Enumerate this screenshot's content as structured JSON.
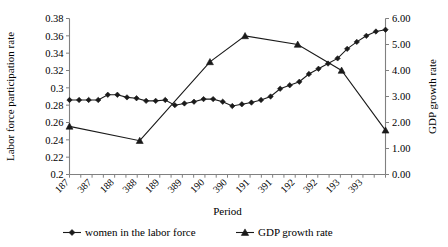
{
  "chart_data": {
    "type": "line",
    "title": "",
    "xlabel": "Period",
    "ylabel": "Labor force participation rate",
    "y2label": "GDP growth rate",
    "grid": false,
    "legend_position": "bottom",
    "ylim": [
      0.2,
      0.38
    ],
    "yticks": [
      "0.2",
      "0.22",
      "0.24",
      "0.26",
      "0.28",
      "0.3",
      "0.32",
      "0.34",
      "0.36",
      "0.38"
    ],
    "ytickvalues": [
      0.2,
      0.22,
      0.24,
      0.26,
      0.28,
      0.3,
      0.32,
      0.34,
      0.36,
      0.38
    ],
    "y2lim": [
      0.0,
      6.0
    ],
    "y2ticks": [
      "0.00",
      "1.00",
      "2.00",
      "3.00",
      "4.00",
      "5.00",
      "6.00"
    ],
    "y2tickvalues": [
      0,
      1,
      2,
      3,
      4,
      5,
      6
    ],
    "xtick_labels": [
      "187",
      "387",
      "188",
      "388",
      "189",
      "389",
      "190",
      "390",
      "191",
      "391",
      "192",
      "392",
      "193",
      "393"
    ],
    "n_points": 28,
    "series": [
      {
        "name": "women in the labor force",
        "marker": "diamond",
        "axis": "left",
        "values": [
          0.286,
          0.286,
          0.286,
          0.286,
          0.292,
          0.292,
          0.289,
          0.288,
          0.285,
          0.285,
          0.286,
          0.28,
          0.282,
          0.284,
          0.287,
          0.287,
          0.284,
          0.279,
          0.281,
          0.283,
          0.286,
          0.29,
          0.299,
          0.303,
          0.307,
          0.316,
          0.322,
          0.328,
          0.334,
          0.345,
          0.353,
          0.36,
          0.365,
          0.367
        ]
      },
      {
        "name": "GDP growth rate",
        "marker": "triangle",
        "axis": "right",
        "x_indices": [
          0,
          8,
          16,
          20,
          26,
          31,
          36
        ],
        "values": [
          1.85,
          1.3,
          4.33,
          5.33,
          5.0,
          4.0,
          1.7
        ]
      }
    ],
    "legend": [
      {
        "label": "women in the labor force",
        "marker": "diamond"
      },
      {
        "label": "GDP growth rate",
        "marker": "triangle"
      }
    ]
  }
}
